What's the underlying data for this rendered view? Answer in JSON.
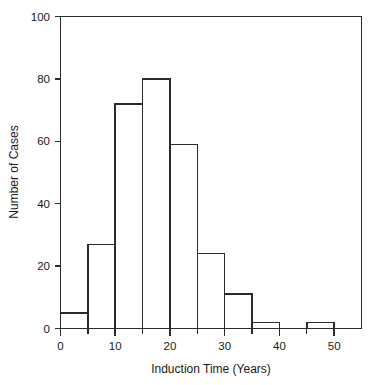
{
  "chart_data": {
    "type": "bar",
    "title": "",
    "subtitle": "",
    "xlabel": "Induction Time (Years)",
    "ylabel": "Number of Cases",
    "categories": [
      "0-5",
      "5-10",
      "10-15",
      "15-20",
      "20-25",
      "25-30",
      "30-35",
      "35-40",
      "40-45",
      "45-50",
      "50-55"
    ],
    "bin_edges": [
      0,
      5,
      10,
      15,
      20,
      25,
      30,
      35,
      40,
      45,
      50,
      55
    ],
    "bin_width": 5,
    "values": [
      5,
      27,
      72,
      80,
      59,
      24,
      11,
      2,
      0,
      2,
      0
    ],
    "xlim": [
      0,
      55
    ],
    "ylim": [
      0,
      100
    ],
    "x_ticks_major": [
      0,
      10,
      20,
      30,
      40,
      50
    ],
    "x_tick_labels": [
      "0",
      "10",
      "20",
      "30",
      "40",
      "50"
    ],
    "x_ticks_minor": [
      5,
      15,
      25,
      35,
      45,
      55
    ],
    "y_ticks": [
      0,
      20,
      40,
      60,
      80,
      100
    ],
    "y_tick_labels": [
      "0",
      "20",
      "40",
      "60",
      "80",
      "100"
    ],
    "grid": false,
    "legend": "none",
    "annotations": [],
    "series_color": "#2b2b2b",
    "background_color": "#ffffff"
  }
}
